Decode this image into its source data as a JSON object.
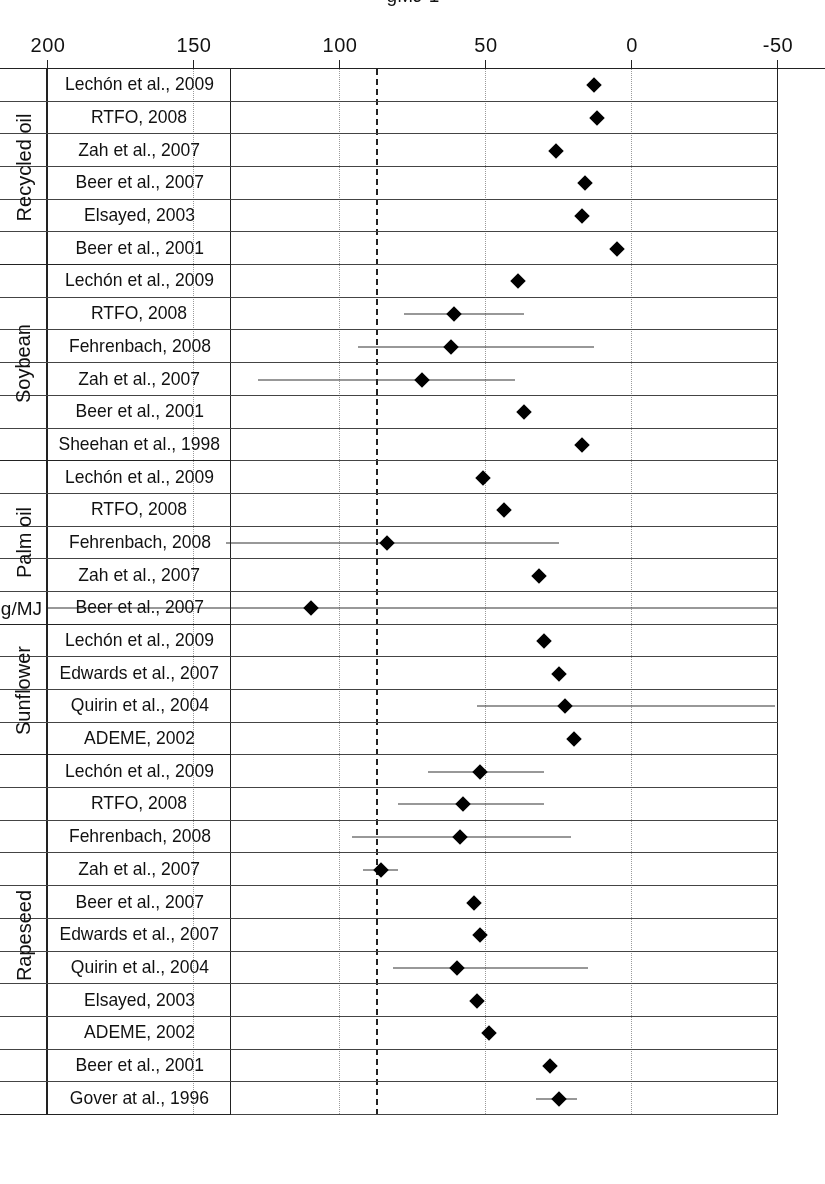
{
  "figure": {
    "axis_title": "gMJ-1",
    "reference_annotation": "1811 g/MJ",
    "reference_line_value": 87,
    "orientation": "rotated-180"
  },
  "axis": {
    "ticks": [
      200,
      150,
      100,
      50,
      0,
      -50
    ],
    "tick_labels": [
      "200",
      "150",
      "100",
      "50",
      "0",
      "-50"
    ],
    "min": -50,
    "max": 200
  },
  "chart_data": {
    "type": "scatter",
    "title": "",
    "subtitle": "",
    "xlabel": "gMJ-1",
    "ylabel": "",
    "xlim": [
      -50,
      200
    ],
    "grid": true,
    "legend": "none",
    "reference_line": {
      "value": 87,
      "style": "dashed",
      "label": "1811 g/MJ"
    },
    "groups": [
      {
        "name": "Rapeseed",
        "points": [
          {
            "study": "Gover at al., 1996",
            "value": 25,
            "low": 19,
            "high": 33
          },
          {
            "study": "Beer et al., 2001",
            "value": 28,
            "low": null,
            "high": null
          },
          {
            "study": "ADEME, 2002",
            "value": 49,
            "low": null,
            "high": null
          },
          {
            "study": "Elsayed, 2003",
            "value": 53,
            "low": null,
            "high": null
          },
          {
            "study": "Quirin et al., 2004",
            "value": 60,
            "low": 15,
            "high": 82
          },
          {
            "study": "Edwards et al., 2007",
            "value": 52,
            "low": null,
            "high": null
          },
          {
            "study": "Beer et al., 2007",
            "value": 54,
            "low": null,
            "high": null
          },
          {
            "study": "Zah et al., 2007",
            "value": 86,
            "low": 80,
            "high": 92
          },
          {
            "study": "Fehrenbach, 2008",
            "value": 59,
            "low": 21,
            "high": 96
          },
          {
            "study": "RTFO, 2008",
            "value": 58,
            "low": 30,
            "high": 80
          },
          {
            "study": "Lechón et al., 2009",
            "value": 52,
            "low": 30,
            "high": 70
          }
        ]
      },
      {
        "name": "Sunflower",
        "points": [
          {
            "study": "ADEME, 2002",
            "value": 20,
            "low": null,
            "high": null
          },
          {
            "study": "Quirin et al., 2004",
            "value": 23,
            "low": -49,
            "high": 53
          },
          {
            "study": "Edwards et al., 2007",
            "value": 25,
            "low": null,
            "high": null
          },
          {
            "study": "Lechón et al., 2009",
            "value": 30,
            "low": null,
            "high": null
          }
        ]
      },
      {
        "name": "Palm oil",
        "points": [
          {
            "study": "Beer et al., 2007",
            "value": 110,
            "low": -50,
            "high": 200
          },
          {
            "study": "Zah et al., 2007",
            "value": 32,
            "low": null,
            "high": null
          },
          {
            "study": "Fehrenbach, 2008",
            "value": 84,
            "low": 25,
            "high": 139
          },
          {
            "study": "RTFO, 2008",
            "value": 44,
            "low": null,
            "high": null
          },
          {
            "study": "Lechón et al., 2009",
            "value": 51,
            "low": null,
            "high": null
          }
        ]
      },
      {
        "name": "Soybean",
        "points": [
          {
            "study": "Sheehan et al., 1998",
            "value": 17,
            "low": null,
            "high": null
          },
          {
            "study": "Beer et al., 2001",
            "value": 37,
            "low": null,
            "high": null
          },
          {
            "study": "Zah et al., 2007",
            "value": 72,
            "low": 40,
            "high": 128
          },
          {
            "study": "Fehrenbach, 2008",
            "value": 62,
            "low": 13,
            "high": 94
          },
          {
            "study": "RTFO, 2008",
            "value": 61,
            "low": 37,
            "high": 78
          },
          {
            "study": "Lechón et al., 2009",
            "value": 39,
            "low": null,
            "high": null
          }
        ]
      },
      {
        "name": "Recycled oil",
        "points": [
          {
            "study": "Beer et al., 2001",
            "value": 5,
            "low": null,
            "high": null
          },
          {
            "study": "Elsayed, 2003",
            "value": 17,
            "low": null,
            "high": null
          },
          {
            "study": "Beer et al., 2007",
            "value": 16,
            "low": null,
            "high": null
          },
          {
            "study": "Zah et al., 2007",
            "value": 26,
            "low": null,
            "high": null
          },
          {
            "study": "RTFO, 2008",
            "value": 12,
            "low": null,
            "high": null
          },
          {
            "study": "Lechón et al., 2009",
            "value": 13,
            "low": null,
            "high": null
          }
        ]
      }
    ]
  }
}
